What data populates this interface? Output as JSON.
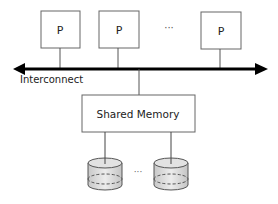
{
  "diagram": {
    "type": "shared-memory-architecture",
    "processors": [
      {
        "label": "P"
      },
      {
        "label": "P"
      },
      {
        "label": "P"
      }
    ],
    "processor_ellipsis": "···",
    "bus": {
      "label": "Interconnect",
      "arrows": "both"
    },
    "memory": {
      "label": "Shared Memory"
    },
    "storage_disks": [
      {
        "id": "disk-1"
      },
      {
        "id": "disk-2"
      }
    ],
    "disk_ellipsis": "···",
    "colors": {
      "stroke": "#555555",
      "bus": "#000000",
      "text": "#222222",
      "disk_fill": "#d9d9d9"
    }
  }
}
